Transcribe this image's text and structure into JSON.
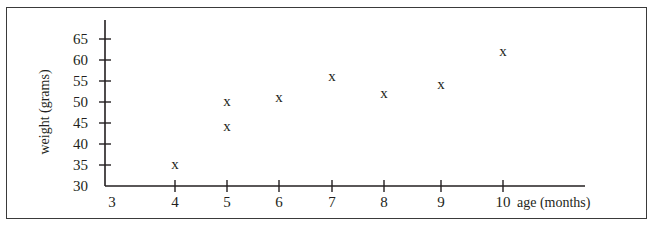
{
  "chart_data": {
    "type": "scatter",
    "title": "",
    "xlabel": "age (months)",
    "ylabel": "weight (grams)",
    "xlim": [
      3,
      10
    ],
    "ylim": [
      30,
      65
    ],
    "x_ticks": [
      3,
      4,
      5,
      6,
      7,
      8,
      9,
      10
    ],
    "y_ticks": [
      30,
      35,
      40,
      45,
      50,
      55,
      60,
      65
    ],
    "grid": false,
    "legend": null,
    "marker": "x",
    "points": [
      {
        "x": 4,
        "y": 35
      },
      {
        "x": 5,
        "y": 44
      },
      {
        "x": 5,
        "y": 50
      },
      {
        "x": 6,
        "y": 51
      },
      {
        "x": 7,
        "y": 56
      },
      {
        "x": 8,
        "y": 52
      },
      {
        "x": 9,
        "y": 54
      },
      {
        "x": 10,
        "y": 62
      }
    ]
  },
  "axes": {
    "x_label": "age (months)",
    "y_label": "weight (grams)",
    "x_tick_labels": [
      "3",
      "4",
      "5",
      "6",
      "7",
      "8",
      "9",
      "10"
    ],
    "y_tick_labels": [
      "30",
      "35",
      "40",
      "45",
      "50",
      "55",
      "60",
      "65"
    ]
  },
  "marker_glyph": "x",
  "colors": {
    "ink": "#231f20",
    "border": "#3a3a3a",
    "background": "#ffffff"
  }
}
